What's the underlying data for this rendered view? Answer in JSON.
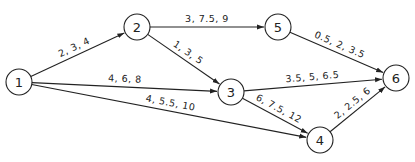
{
  "diagram": {
    "type": "activity-network",
    "colors": {
      "stroke": "#222222",
      "background": "#ffffff"
    },
    "nodes": [
      {
        "id": "1",
        "label": "1",
        "x": 19,
        "y": 82
      },
      {
        "id": "2",
        "label": "2",
        "x": 137,
        "y": 27
      },
      {
        "id": "3",
        "label": "3",
        "x": 231,
        "y": 92
      },
      {
        "id": "4",
        "label": "4",
        "x": 320,
        "y": 140
      },
      {
        "id": "5",
        "label": "5",
        "x": 278,
        "y": 27
      },
      {
        "id": "6",
        "label": "6",
        "x": 396,
        "y": 78
      }
    ],
    "edges": [
      {
        "from": "1",
        "to": "2",
        "label": "2, 3, 4"
      },
      {
        "from": "1",
        "to": "3",
        "label": "4, 6, 8"
      },
      {
        "from": "1",
        "to": "4",
        "label": "4, 5.5, 10"
      },
      {
        "from": "2",
        "to": "5",
        "label": "3, 7.5, 9"
      },
      {
        "from": "2",
        "to": "3",
        "label": "1, 3, 5"
      },
      {
        "from": "5",
        "to": "6",
        "label": "0.5, 2, 3.5"
      },
      {
        "from": "3",
        "to": "6",
        "label": "3.5, 5, 6.5"
      },
      {
        "from": "3",
        "to": "4",
        "label": "6, 7.5, 12"
      },
      {
        "from": "4",
        "to": "6",
        "label": "2, 2.5, 6"
      }
    ]
  }
}
